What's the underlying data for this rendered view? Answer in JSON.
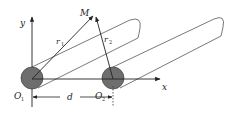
{
  "diagram": {
    "type": "two-wire transmission line geometry",
    "labels": {
      "y_axis": "y",
      "x_axis": "x",
      "point": "M",
      "r1_main": "r",
      "r1_sub": "1",
      "r2_main": "r",
      "r2_sub": "2",
      "o1_main": "O",
      "o1_sub": "1",
      "o2_main": "O",
      "o2_sub": "2",
      "distance": "d"
    },
    "colors": {
      "line": "#222222",
      "conductor_fill": "#6e6e6e",
      "cylinder_outline": "#555555"
    }
  }
}
